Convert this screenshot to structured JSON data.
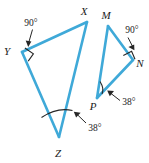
{
  "figure": {
    "background_color": "#ffffff",
    "line_color": "#3fa9d8",
    "mark_color": "#262626",
    "triangles": [
      {
        "name": "triangle-xyz",
        "vertices": [
          {
            "label": "X",
            "x": 87,
            "y": 22,
            "label_x": 84,
            "label_y": 15
          },
          {
            "label": "Y",
            "x": 22,
            "y": 52,
            "label_x": 5,
            "label_y": 54
          },
          {
            "label": "Z",
            "x": 59,
            "y": 137,
            "label_x": 55,
            "label_y": 153
          }
        ],
        "angles": [
          {
            "at": "Y",
            "value": "90°",
            "label_x": 20,
            "label_y": 26
          },
          {
            "at": "Z",
            "value": "38°",
            "label_x": 74,
            "label_y": 131
          }
        ]
      },
      {
        "name": "triangle-mnp",
        "vertices": [
          {
            "label": "M",
            "x": 108,
            "y": 26,
            "label_x": 104,
            "label_y": 19
          },
          {
            "label": "N",
            "x": 133,
            "y": 60,
            "label_x": 136,
            "label_y": 66
          },
          {
            "label": "P",
            "x": 97,
            "y": 98,
            "label_x": 89,
            "label_y": 110
          }
        ],
        "angles": [
          {
            "at": "N",
            "value": "90°",
            "label_x": 120,
            "label_y": 34
          },
          {
            "at": "P",
            "value": "38°",
            "label_x": 114,
            "label_y": 108
          }
        ]
      }
    ],
    "labels": {
      "vertex_x": "X",
      "vertex_y": "Y",
      "vertex_z": "Z",
      "vertex_m": "M",
      "vertex_n": "N",
      "vertex_p": "P",
      "angle_y": "90°",
      "angle_z": "38°",
      "angle_n": "90°",
      "angle_p": "38°"
    }
  }
}
